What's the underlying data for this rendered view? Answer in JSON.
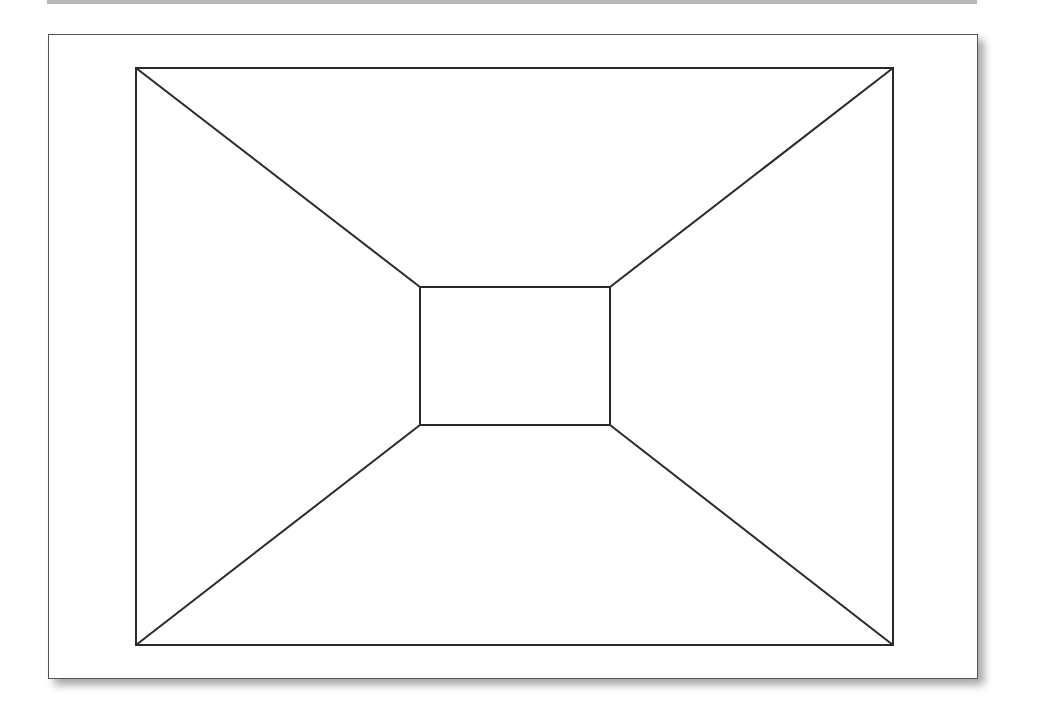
{
  "diagram": {
    "title": "",
    "stroke_color": "#2a2a2a",
    "outer_rect": {
      "x1": 136,
      "y1": 68,
      "x2": 893,
      "y2": 645
    },
    "inner_rect": {
      "x1": 420,
      "y1": 287,
      "x2": 610,
      "y2": 425
    },
    "connectors": [
      {
        "from": "outer-top-left",
        "to": "inner-top-left"
      },
      {
        "from": "outer-top-right",
        "to": "inner-top-right"
      },
      {
        "from": "outer-bottom-left",
        "to": "inner-bottom-left"
      },
      {
        "from": "outer-bottom-right",
        "to": "inner-bottom-right"
      }
    ]
  }
}
